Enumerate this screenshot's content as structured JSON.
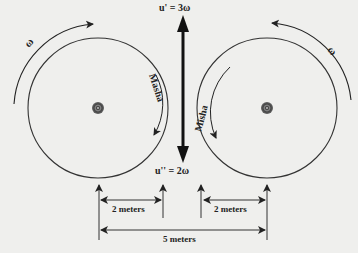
{
  "figure": {
    "colors": {
      "background": "#efefed",
      "ink": "#222222",
      "hub": "#555555"
    },
    "rotation_symbol_left": "ω",
    "rotation_symbol_right": "ω",
    "left_wheel": {
      "rider_label": "Masha",
      "center": [
        98,
        108
      ],
      "radius": 70
    },
    "right_wheel": {
      "rider_label": "Misha",
      "center": [
        267,
        108
      ],
      "radius": 70
    },
    "velocity_up_label": "u' = 3ω",
    "velocity_down_label": "u'' = 2ω",
    "dimension_left": "2 meters",
    "dimension_right": "2 meters",
    "dimension_total": "5 meters"
  }
}
